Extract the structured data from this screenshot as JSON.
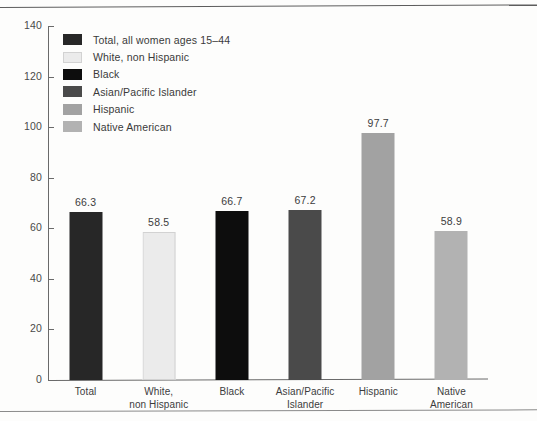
{
  "chart_data": {
    "type": "bar",
    "title": "",
    "subtitle": "",
    "xlabel": "",
    "ylabel": "",
    "ylim": [
      0,
      140
    ],
    "yticks": [
      0,
      20,
      40,
      60,
      80,
      100,
      120,
      140
    ],
    "grid": false,
    "legend_position": "inside-top-left",
    "categories": [
      "Total",
      "White, non Hispanic",
      "Black",
      "Asian/Pacific Islander",
      "Hispanic",
      "Native American"
    ],
    "category_labels_wrapped": [
      {
        "line1": "Total",
        "line2": ""
      },
      {
        "line1": "White,",
        "line2": "non Hispanic"
      },
      {
        "line1": "Black",
        "line2": ""
      },
      {
        "line1": "Asian/Pacific",
        "line2": "Islander"
      },
      {
        "line1": "Hispanic",
        "line2": ""
      },
      {
        "line1": "Native",
        "line2": "American"
      }
    ],
    "values": [
      66.3,
      58.5,
      66.7,
      67.2,
      97.7,
      58.9
    ],
    "value_labels": [
      "66.3",
      "58.5",
      "66.7",
      "67.2",
      "97.7",
      "58.9"
    ],
    "colors": [
      "#272727",
      "#ebebeb",
      "#0d0d0d",
      "#4a4a4a",
      "#a2a2a2",
      "#b2b2b2"
    ],
    "legend": [
      {
        "label": "Total, all women ages 15–44",
        "color": "#272727"
      },
      {
        "label": "White, non Hispanic",
        "color": "#ebebeb"
      },
      {
        "label": "Black",
        "color": "#0d0d0d"
      },
      {
        "label": "Asian/Pacific Islander",
        "color": "#4a4a4a"
      },
      {
        "label": "Hispanic",
        "color": "#a2a2a2"
      },
      {
        "label": "Native American",
        "color": "#b2b2b2"
      }
    ]
  },
  "axis": {
    "y_tick_labels": [
      "140",
      "120",
      "100",
      "80",
      "60",
      "40",
      "20",
      "0"
    ]
  }
}
